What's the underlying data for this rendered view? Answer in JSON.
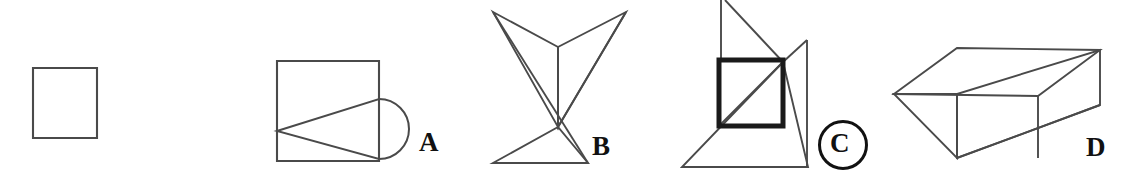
{
  "page": {
    "background_color": "#ffffff",
    "stroke_color": "#4a4a4a",
    "bold_stroke_color": "#1a1a1a",
    "label_color": "#111111",
    "width": 1128,
    "height": 173
  },
  "prompt": {
    "name": "prompt-square",
    "description": "plain square figure shown at left as the question stimulus",
    "bounds": {
      "x": 33,
      "y": 68,
      "width": 64,
      "height": 70
    }
  },
  "options": [
    {
      "key": "A",
      "label": "A",
      "label_position": {
        "x": 419,
        "y": 129
      },
      "selected": false,
      "description": "square with inscribed triangle and semicircle bulging from right side",
      "bounds": {
        "x": 277,
        "y": 61,
        "width": 130,
        "height": 100
      }
    },
    {
      "key": "B",
      "label": "B",
      "label_position": {
        "x": 592,
        "y": 133
      },
      "selected": false,
      "description": "arrow-like bowtie of two upper wedges meeting a lower triangle",
      "bounds": {
        "x": 493,
        "y": 12,
        "width": 133,
        "height": 151
      }
    },
    {
      "key": "C",
      "label": "C",
      "label_position": {
        "x": 830,
        "y": 130
      },
      "selected": true,
      "selection_marker": "circle",
      "description": "bold square overlaid on large triangle with upper diagonal lines",
      "bounds": {
        "x": 682,
        "y": 0,
        "width": 126,
        "height": 167
      }
    },
    {
      "key": "D",
      "label": "D",
      "label_position": {
        "x": 1086,
        "y": 134
      },
      "selected": false,
      "description": "three-dimensional open rectangular prism drawn in perspective",
      "bounds": {
        "x": 894,
        "y": 48,
        "width": 206,
        "height": 115
      }
    }
  ],
  "geometry": {
    "prompt_square": {
      "points": "33,68 97,68 97,138 33,138"
    },
    "option_a": {
      "square": "277,61 379,61 379,161 277,161",
      "triangle": "277,131 379,99 379,159",
      "semicircle_path": "M 379,99 A 30,30 0 0 1 379,159"
    },
    "option_b": {
      "left_wedge": "493,12 558,47 558,127",
      "right_wedge": "626,12 558,47 558,127",
      "lower_triangle": "558,127 493,163 588,163",
      "center_stem": "558,47 558,127",
      "left_long_edge": "493,12 588,163",
      "right_long_edge": "626,12 558,127"
    },
    "option_c": {
      "bold_square": "719,60 783,60 783,126 719,126",
      "big_triangle": "783,62 682,167 808,167",
      "left_vertical": "721,0 721,60",
      "top_diagonal": "725,0 783,62",
      "peak_line": "783,62 807,40",
      "right_vertical": "807,40 807,167",
      "inner_diagonal": "719,126 783,62"
    },
    "option_d": {
      "top_face": "894,94 957,48 1100,50 1038,96",
      "front_face": "957,94 957,158 1100,105 1100,50",
      "left_face": "894,94 957,94 957,158",
      "divider": "1038,96 1038,158",
      "bottom_edge": "957,158 1100,105"
    }
  }
}
